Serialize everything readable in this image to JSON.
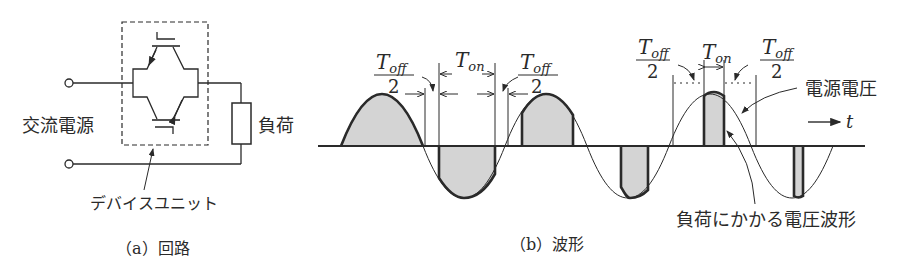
{
  "circuit": {
    "source_label": "交流電源",
    "load_label": "負荷",
    "device_label": "デバイスユニット",
    "caption": "（a）回路"
  },
  "waveform": {
    "caption": "（b）波形",
    "supply_voltage_label": "電源電圧",
    "load_voltage_label": "負荷にかかる電圧波形",
    "time_axis_label": "t",
    "t_on_label": "T",
    "t_on_sub": "on",
    "t_off_label": "T",
    "t_off_sub": "off",
    "half_denominator": "2"
  },
  "colors": {
    "line": "#2a2a2a",
    "fill": "#d4d4d4",
    "background": "#ffffff"
  }
}
